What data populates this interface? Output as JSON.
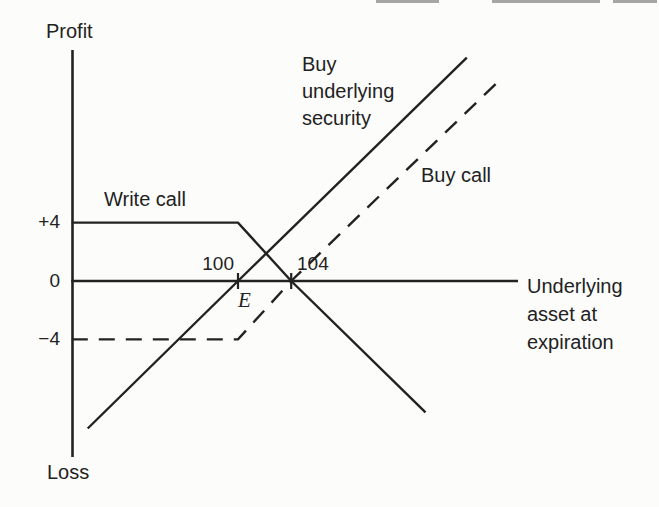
{
  "colors": {
    "ink": "#222222",
    "paper": "#fcfcfb",
    "artifact": "#8a8a8a"
  },
  "chart_data": {
    "type": "line",
    "axis_labels": {
      "y_top": "Profit",
      "y_bottom": "Loss",
      "x_lines": [
        "Underlying",
        "asset at",
        "expiration"
      ]
    },
    "y_ticks": [
      {
        "value": 4,
        "label": "+4"
      },
      {
        "value": 0,
        "label": "0"
      },
      {
        "value": -4,
        "label": "−4"
      }
    ],
    "x_ticks": [
      {
        "value": 100,
        "label": "100"
      },
      {
        "value": 104,
        "label": "104"
      }
    ],
    "exercise_marker": {
      "label": "E",
      "value": 100
    },
    "series": [
      {
        "name": "Buy underlying security",
        "label_lines": [
          "Buy",
          "underlying",
          "security"
        ],
        "style": "solid",
        "points": [
          [
            88.7,
            -10.1
          ],
          [
            100,
            0
          ],
          [
            117.2,
            15.3
          ]
        ]
      },
      {
        "name": "Write call",
        "label_lines": [
          "Write call"
        ],
        "style": "solid",
        "points": [
          [
            87.5,
            4
          ],
          [
            100,
            4
          ],
          [
            104,
            0
          ],
          [
            114.1,
            -9.0
          ]
        ]
      },
      {
        "name": "Buy call",
        "label_lines": [
          "Buy call"
        ],
        "style": "dashed",
        "points": [
          [
            87.5,
            -4
          ],
          [
            100,
            -4
          ],
          [
            104,
            0
          ],
          [
            119.5,
            13.6
          ]
        ]
      }
    ],
    "xlim": [
      87.5,
      121
    ],
    "ylim": [
      -12,
      15.8
    ],
    "grid": false,
    "legend": "inline-annotations"
  }
}
